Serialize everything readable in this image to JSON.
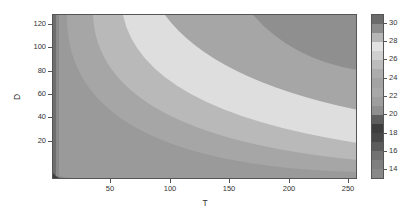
{
  "chart_data": {
    "type": "heatmap",
    "subtype": "filled-contour",
    "title": "",
    "xlabel": "T",
    "ylabel": "D",
    "xlim": [
      1,
      256
    ],
    "ylim": [
      1,
      138
    ],
    "xticks": [
      50,
      100,
      150,
      200,
      250
    ],
    "yticks": [
      20,
      40,
      60,
      80,
      100,
      120
    ],
    "colorbar": {
      "ticks": [
        14,
        16,
        18,
        20,
        22,
        24,
        26,
        28,
        30
      ],
      "range": [
        13.5,
        31.5
      ],
      "levels": [
        {
          "value": 31,
          "color": "#6b6b6b"
        },
        {
          "value": 30,
          "color": "#8c8c8c"
        },
        {
          "value": 29,
          "color": "#b6b6b6"
        },
        {
          "value": 28,
          "color": "#e2e2e2"
        },
        {
          "value": 27,
          "color": "#cfcfcf"
        },
        {
          "value": 26,
          "color": "#bcbcbc"
        },
        {
          "value": 25,
          "color": "#acacac"
        },
        {
          "value": 24,
          "color": "#a3a3a3"
        },
        {
          "value": 23,
          "color": "#a8a8a8"
        },
        {
          "value": 22,
          "color": "#9e9e9e"
        },
        {
          "value": 21,
          "color": "#8f8f8f"
        },
        {
          "value": 20,
          "color": "#5e5e5e"
        },
        {
          "value": 19,
          "color": "#3e3e3e"
        },
        {
          "value": 18,
          "color": "#484848"
        },
        {
          "value": 17,
          "color": "#5c5c5c"
        },
        {
          "value": 16,
          "color": "#727272"
        },
        {
          "value": 15,
          "color": "#7f7f7f"
        },
        {
          "value": 14,
          "color": "#888888"
        }
      ]
    }
  }
}
